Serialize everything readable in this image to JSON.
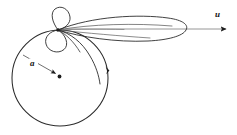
{
  "figure": {
    "kind": "trochoid-rolling-circle-diagram",
    "background_color": "#ffffff",
    "curve_color": "#2b2b2b",
    "axis_color": "#7c7c7c",
    "label_color": "#111111",
    "labels": {
      "radius_label": "a",
      "velocity_label": "u"
    },
    "geometry": {
      "canvas_width": 237,
      "canvas_height": 135,
      "circle": {
        "center_x": 60,
        "center_y": 78,
        "radius": 48
      },
      "cusp_point": {
        "x": 58,
        "y": 30
      },
      "radius_arrow": {
        "from_x": 23,
        "from_y": 55,
        "to_x": 58,
        "to_y": 75
      },
      "circle_direction_marker": {
        "x": 107,
        "y": 70
      },
      "velocity_axis": {
        "from_x": 58,
        "from_y": 29,
        "to_x": 228,
        "to_y": 29
      },
      "velocity_label_pos": {
        "x": 218,
        "y": 16
      },
      "radius_label_pos": {
        "x": 33,
        "y": 64
      },
      "large_lobe": {
        "tip_x": 58,
        "tip_y": 30,
        "end_x": 186,
        "end_y": 29
      },
      "small_lobe_upper": {
        "tip_x": 58,
        "tip_y": 30,
        "top_y": 8
      },
      "small_lobe_lower": {
        "tip_x": 58,
        "tip_y": 30,
        "bottom_y": 53
      }
    }
  }
}
